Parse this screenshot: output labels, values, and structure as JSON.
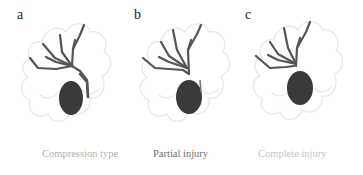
{
  "figure": {
    "panels": [
      {
        "letter": "a",
        "caption": "Compression type",
        "caption_color": "#b0b0b0"
      },
      {
        "letter": "b",
        "caption": "Partial injury",
        "caption_color": "#6e6e6e"
      },
      {
        "letter": "c",
        "caption": "Complete injury",
        "caption_color": "#c4c4c4"
      }
    ],
    "colors": {
      "duct": "#555555",
      "gallbladder": "#3a3a3a",
      "organ_outline": "#e6e6e6"
    }
  }
}
